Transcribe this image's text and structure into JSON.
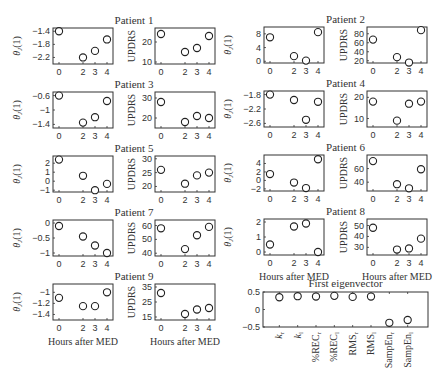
{
  "chart_data": {
    "type": "scatter",
    "x_ticks": [
      0,
      2,
      3,
      4
    ],
    "xlabel": "Hours after MED",
    "ylabel_theta": "θJ(1)",
    "ylabel_updrs": "UPDRS",
    "patients": [
      {
        "name": "Patient 1",
        "theta": {
          "ylim": [
            -2.4,
            -1.3
          ],
          "yticks": [
            "-1.4",
            "-1.8",
            "-2.2"
          ],
          "ytick_vals": [
            -1.4,
            -1.8,
            -2.2
          ],
          "values": [
            -1.4,
            -2.2,
            -2.0,
            -1.65
          ]
        },
        "updrs": {
          "ylim": [
            9,
            27
          ],
          "yticks": [
            "20",
            "10"
          ],
          "ytick_vals": [
            20,
            10
          ],
          "values": [
            24,
            15,
            17,
            23
          ]
        }
      },
      {
        "name": "Patient 2",
        "theta": {
          "ylim": [
            -0.5,
            10
          ],
          "yticks": [
            "8",
            "4",
            "0"
          ],
          "ytick_vals": [
            8,
            4,
            0
          ],
          "values": [
            7,
            1.5,
            0.2,
            8.5
          ]
        },
        "updrs": {
          "ylim": [
            15,
            95
          ],
          "yticks": [
            "80",
            "60",
            "40",
            "20"
          ],
          "ytick_vals": [
            80,
            60,
            40,
            20
          ],
          "values": [
            67,
            28,
            16,
            88
          ]
        }
      },
      {
        "name": "Patient 3",
        "theta": {
          "ylim": [
            -1.5,
            -0.5
          ],
          "yticks": [
            "-0.6",
            "-1",
            "-1.4"
          ],
          "ytick_vals": [
            -0.6,
            -1,
            -1.4
          ],
          "values": [
            -0.6,
            -1.35,
            -1.2,
            -0.75
          ]
        },
        "updrs": {
          "ylim": [
            15,
            33
          ],
          "yticks": [
            "30",
            "20"
          ],
          "ytick_vals": [
            30,
            20
          ],
          "values": [
            28,
            18,
            21,
            20
          ]
        }
      },
      {
        "name": "Patient 4",
        "theta": {
          "ylim": [
            -2.7,
            -1.7
          ],
          "yticks": [
            "-1.8",
            "-2.2",
            "-2.6"
          ],
          "ytick_vals": [
            -1.8,
            -2.2,
            -2.6
          ],
          "values": [
            -1.8,
            -1.95,
            -2.5,
            -2.0
          ]
        },
        "updrs": {
          "ylim": [
            6,
            23
          ],
          "yticks": [
            "20",
            "10"
          ],
          "ytick_vals": [
            20,
            10
          ],
          "values": [
            18,
            9,
            17,
            18
          ]
        }
      },
      {
        "name": "Patient 5",
        "theta": {
          "ylim": [
            -1.2,
            2.8
          ],
          "yticks": [
            "2",
            "1",
            "0",
            "-1"
          ],
          "ytick_vals": [
            2,
            1,
            0,
            -1
          ],
          "values": [
            2.4,
            0.6,
            -1.0,
            -0.3
          ]
        },
        "updrs": {
          "ylim": [
            18,
            31
          ],
          "yticks": [
            "30",
            "25",
            "20"
          ],
          "ytick_vals": [
            30,
            25,
            20
          ],
          "values": [
            26,
            21,
            24,
            25
          ]
        }
      },
      {
        "name": "Patient 6",
        "theta": {
          "ylim": [
            -2.5,
            6
          ],
          "yticks": [
            "4",
            "2",
            "0",
            "-2"
          ],
          "ytick_vals": [
            4,
            2,
            0,
            -2
          ],
          "values": [
            1.5,
            -0.5,
            -1.8,
            5
          ]
        },
        "updrs": {
          "ylim": [
            27,
            80
          ],
          "yticks": [
            "60",
            "40"
          ],
          "ytick_vals": [
            60,
            40
          ],
          "values": [
            71,
            37,
            31,
            59
          ]
        }
      },
      {
        "name": "Patient 7",
        "theta": {
          "ylim": [
            -1.1,
            0.1
          ],
          "yticks": [
            "0",
            "-0.5",
            "-1"
          ],
          "ytick_vals": [
            0,
            -0.5,
            -1
          ],
          "values": [
            -0.1,
            -0.45,
            -0.75,
            -1.0
          ]
        },
        "updrs": {
          "ylim": [
            38,
            64
          ],
          "yticks": [
            "60",
            "50",
            "40"
          ],
          "ytick_vals": [
            60,
            50,
            40
          ],
          "values": [
            58,
            43,
            53,
            59
          ]
        }
      },
      {
        "name": "Patient 8",
        "theta": {
          "ylim": [
            -0.2,
            2.2
          ],
          "yticks": [
            "2",
            "1",
            "0"
          ],
          "ytick_vals": [
            2,
            1,
            0
          ],
          "values": [
            0.5,
            1.7,
            1.9,
            0.0
          ]
        },
        "updrs": {
          "ylim": [
            23,
            56
          ],
          "yticks": [
            "50",
            "40",
            "30"
          ],
          "ytick_vals": [
            50,
            40,
            30
          ],
          "values": [
            48,
            28,
            29,
            38
          ]
        }
      },
      {
        "name": "Patient 9",
        "theta": {
          "ylim": [
            -1.5,
            -0.85
          ],
          "yticks": [
            "-1",
            "-1.2",
            "-1.4"
          ],
          "ytick_vals": [
            -1,
            -1.2,
            -1.4
          ],
          "values": [
            -1.1,
            -1.25,
            -1.25,
            -1.0
          ]
        },
        "updrs": {
          "ylim": [
            13,
            37
          ],
          "yticks": [
            "35",
            "25",
            "15"
          ],
          "ytick_vals": [
            35,
            25,
            15
          ],
          "values": [
            31,
            17,
            20,
            21
          ]
        }
      }
    ],
    "eigenvector": {
      "title": "First eigenvector",
      "type": "scatter",
      "ylim": [
        -0.5,
        0.5
      ],
      "yticks": [
        "0.5",
        "0",
        "-0.5"
      ],
      "ytick_vals": [
        0.5,
        0,
        -0.5
      ],
      "categories": [
        "k_r",
        "k_l",
        "%REC_r",
        "%REC_l",
        "RMS_r",
        "RMS_l",
        "SampEn_r",
        "SampEn_l"
      ],
      "category_labels": [
        {
          "base": "k",
          "sub": "r"
        },
        {
          "base": "k",
          "sub": "l"
        },
        {
          "base": "%REC",
          "sub": "r"
        },
        {
          "base": "%REC",
          "sub": "l"
        },
        {
          "base": "RMS",
          "sub": "r"
        },
        {
          "base": "RMS",
          "sub": "l"
        },
        {
          "base": "SampEn",
          "sub": "r"
        },
        {
          "base": "SampEn",
          "sub": "l"
        }
      ],
      "values": [
        0.35,
        0.38,
        0.37,
        0.39,
        0.36,
        0.37,
        -0.38,
        -0.3
      ]
    }
  },
  "layout": {
    "left_group": {
      "theta_x": [
        53,
        113
      ],
      "updrs_x": [
        155,
        215
      ],
      "row_tops": [
        28,
        92,
        156,
        220,
        284
      ],
      "patients": [
        0,
        2,
        4,
        6,
        8
      ]
    },
    "right_group": {
      "theta_x": [
        264,
        324
      ],
      "updrs_x": [
        367,
        427
      ],
      "row_tops": [
        27,
        91,
        155,
        219
      ],
      "patients": [
        1,
        3,
        5,
        7
      ]
    },
    "plot_height": 36,
    "eig": {
      "x": [
        263,
        428
      ],
      "y": [
        292,
        327
      ]
    }
  }
}
